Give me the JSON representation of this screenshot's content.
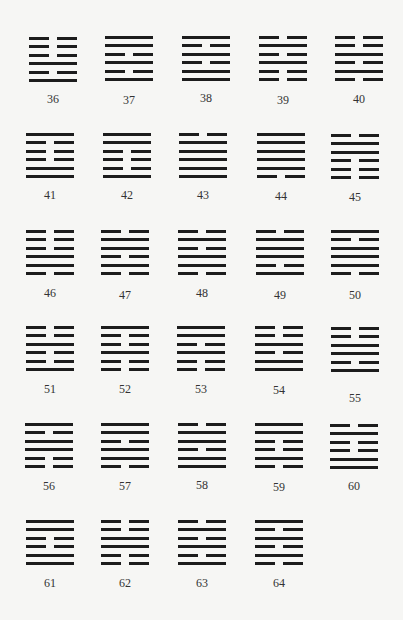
{
  "page": {
    "background_color": "#f6f6f4",
    "line_color": "#1c1c1c"
  },
  "legend": {
    "note": "Lines listed top to bottom; 1 = solid (yang), 0 = broken (yin)"
  },
  "hexagrams": [
    {
      "number": "36",
      "lines": [
        0,
        0,
        0,
        1,
        0,
        1
      ],
      "x": 29,
      "y": 37,
      "label_dy": 55
    },
    {
      "number": "37",
      "lines": [
        1,
        1,
        0,
        1,
        0,
        1
      ],
      "x": 105,
      "y": 36,
      "label_dy": 57
    },
    {
      "number": "38",
      "lines": [
        1,
        0,
        1,
        0,
        1,
        1
      ],
      "x": 182,
      "y": 36,
      "label_dy": 55
    },
    {
      "number": "39",
      "lines": [
        0,
        1,
        0,
        1,
        0,
        0
      ],
      "x": 259,
      "y": 36,
      "label_dy": 57
    },
    {
      "number": "40",
      "lines": [
        0,
        0,
        1,
        0,
        1,
        0
      ],
      "x": 335,
      "y": 36,
      "label_dy": 56
    },
    {
      "number": "41",
      "lines": [
        1,
        0,
        0,
        0,
        1,
        1
      ],
      "x": 26,
      "y": 133,
      "label_dy": 55
    },
    {
      "number": "42",
      "lines": [
        1,
        1,
        0,
        0,
        0,
        1
      ],
      "x": 103,
      "y": 133,
      "label_dy": 55
    },
    {
      "number": "43",
      "lines": [
        0,
        1,
        1,
        1,
        1,
        1
      ],
      "x": 179,
      "y": 133,
      "label_dy": 55
    },
    {
      "number": "44",
      "lines": [
        1,
        1,
        1,
        1,
        1,
        0
      ],
      "x": 257,
      "y": 133,
      "label_dy": 56
    },
    {
      "number": "45",
      "lines": [
        0,
        1,
        1,
        0,
        0,
        0
      ],
      "x": 331,
      "y": 134,
      "label_dy": 56
    },
    {
      "number": "46",
      "lines": [
        0,
        0,
        0,
        1,
        1,
        0
      ],
      "x": 26,
      "y": 230,
      "label_dy": 56
    },
    {
      "number": "47",
      "lines": [
        0,
        1,
        1,
        0,
        1,
        0
      ],
      "x": 101,
      "y": 230,
      "label_dy": 58
    },
    {
      "number": "48",
      "lines": [
        0,
        1,
        0,
        1,
        1,
        0
      ],
      "x": 178,
      "y": 230,
      "label_dy": 56
    },
    {
      "number": "49",
      "lines": [
        0,
        1,
        1,
        1,
        0,
        1
      ],
      "x": 256,
      "y": 230,
      "label_dy": 58
    },
    {
      "number": "50",
      "lines": [
        1,
        0,
        1,
        1,
        1,
        0
      ],
      "x": 331,
      "y": 230,
      "label_dy": 58
    },
    {
      "number": "51",
      "lines": [
        0,
        0,
        1,
        0,
        0,
        1
      ],
      "x": 26,
      "y": 326,
      "label_dy": 56
    },
    {
      "number": "52",
      "lines": [
        1,
        0,
        0,
        1,
        0,
        0
      ],
      "x": 101,
      "y": 326,
      "label_dy": 56
    },
    {
      "number": "53",
      "lines": [
        1,
        1,
        0,
        1,
        0,
        0
      ],
      "x": 177,
      "y": 326,
      "label_dy": 56
    },
    {
      "number": "54",
      "lines": [
        0,
        0,
        1,
        0,
        1,
        1
      ],
      "x": 255,
      "y": 326,
      "label_dy": 57
    },
    {
      "number": "55",
      "lines": [
        0,
        0,
        1,
        1,
        0,
        1
      ],
      "x": 331,
      "y": 327,
      "label_dy": 64
    },
    {
      "number": "56",
      "lines": [
        1,
        0,
        1,
        1,
        0,
        0
      ],
      "x": 25,
      "y": 423,
      "label_dy": 56
    },
    {
      "number": "57",
      "lines": [
        1,
        1,
        0,
        1,
        1,
        0
      ],
      "x": 101,
      "y": 423,
      "label_dy": 56
    },
    {
      "number": "58",
      "lines": [
        0,
        1,
        1,
        0,
        1,
        1
      ],
      "x": 178,
      "y": 423,
      "label_dy": 55
    },
    {
      "number": "59",
      "lines": [
        1,
        1,
        0,
        0,
        1,
        0
      ],
      "x": 255,
      "y": 423,
      "label_dy": 57
    },
    {
      "number": "60",
      "lines": [
        0,
        1,
        0,
        0,
        1,
        1
      ],
      "x": 330,
      "y": 424,
      "label_dy": 55
    },
    {
      "number": "61",
      "lines": [
        1,
        1,
        0,
        0,
        1,
        1
      ],
      "x": 26,
      "y": 520,
      "label_dy": 56
    },
    {
      "number": "62",
      "lines": [
        0,
        0,
        1,
        1,
        0,
        0
      ],
      "x": 101,
      "y": 520,
      "label_dy": 56
    },
    {
      "number": "63",
      "lines": [
        0,
        1,
        0,
        1,
        0,
        1
      ],
      "x": 178,
      "y": 520,
      "label_dy": 56
    },
    {
      "number": "64",
      "lines": [
        1,
        0,
        1,
        0,
        1,
        0
      ],
      "x": 255,
      "y": 520,
      "label_dy": 56
    }
  ]
}
